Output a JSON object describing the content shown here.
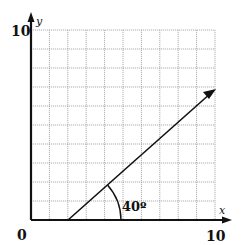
{
  "diagram": {
    "type": "coordinate-grid-with-ray",
    "x_axis": {
      "label": "x",
      "min": 0,
      "max": 10,
      "tick_labels": [
        "0",
        "10"
      ]
    },
    "y_axis": {
      "label": "y",
      "min": 0,
      "max": 10,
      "tick_labels": [
        "10"
      ]
    },
    "grid": {
      "divisions": 10,
      "color": "#9a9a9a"
    },
    "ray": {
      "start": [
        2,
        0
      ],
      "end": [
        10,
        6.7
      ],
      "color": "#111111"
    },
    "angle": {
      "label": "40°",
      "degrees": 40
    },
    "labels": {
      "origin": "0",
      "x_max": "10",
      "y_max": "10",
      "x_axis": "x",
      "y_axis": "y",
      "angle": "40º"
    }
  }
}
